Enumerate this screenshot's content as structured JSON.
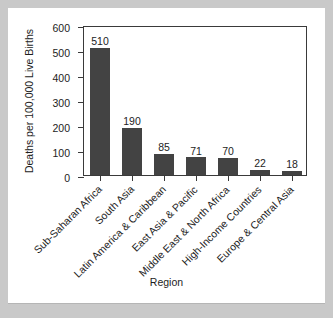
{
  "chart_data": {
    "type": "bar",
    "title": "",
    "xlabel": "Region",
    "ylabel": "Deaths per 100,000 Live Births",
    "ylim": [
      0,
      600
    ],
    "ytick_labels": [
      "0",
      "100",
      "200",
      "300",
      "400",
      "500",
      "600"
    ],
    "ytick_values": [
      0,
      100,
      200,
      300,
      400,
      500,
      600
    ],
    "grid": false,
    "legend": "none",
    "bar_color": "#434343",
    "axis_color": "#3a3a3a",
    "categories": [
      "Sub-Saharan Africa",
      "South Asia",
      "Latin America & Caribbean",
      "East Asia & Pacific",
      "Middle East & North Africa",
      "High-Income Countries",
      "Europe & Central Asia"
    ],
    "values": [
      510,
      190,
      85,
      71,
      70,
      22,
      18
    ],
    "value_labels": [
      "510",
      "190",
      "85",
      "71",
      "70",
      "22",
      "18"
    ]
  }
}
